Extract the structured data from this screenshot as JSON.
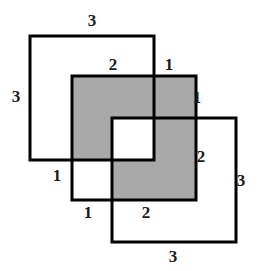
{
  "figure": {
    "kind": "overlapping-squares-diagram",
    "background_color": "#ffffff",
    "stroke_color": "#000000",
    "shaded_fill_color": "#a9a9a9",
    "white_fill_color": "#ffffff",
    "stroke_width": 3,
    "canvas": {
      "width": 260,
      "height": 271
    }
  },
  "squares": [
    {
      "id": "square-top-left",
      "name": "Square 1",
      "x": 30,
      "y": 36,
      "size": 124,
      "side_label": "3",
      "filled": false
    },
    {
      "id": "square-middle-shaded",
      "name": "Square 2",
      "x": 72,
      "y": 76,
      "size": 124,
      "side_label": "3",
      "filled": true
    },
    {
      "id": "square-bottom-right",
      "name": "Square 3",
      "x": 112,
      "y": 118,
      "size": 124,
      "side_label": "3",
      "filled": false
    }
  ],
  "labels": [
    {
      "id": "label-top-3",
      "text": "3",
      "x": 92,
      "y": 20,
      "edge": "top-of-square-1"
    },
    {
      "id": "label-left-3",
      "text": "3",
      "x": 16,
      "y": 96,
      "edge": "left-of-square-1"
    },
    {
      "id": "label-top-2",
      "text": "2",
      "x": 113,
      "y": 64,
      "edge": "top-of-square-2-left-part"
    },
    {
      "id": "label-top-1",
      "text": "1",
      "x": 169,
      "y": 64,
      "edge": "top-of-square-2-right-part"
    },
    {
      "id": "label-right-upper-1",
      "text": "1",
      "x": 197,
      "y": 97,
      "edge": "right-of-square-2-upper-part"
    },
    {
      "id": "label-right-2",
      "text": "2",
      "x": 201,
      "y": 156,
      "edge": "right-of-square-2-lower-part"
    },
    {
      "id": "label-far-right-3",
      "text": "3",
      "x": 241,
      "y": 180,
      "edge": "right-of-square-3"
    },
    {
      "id": "label-left-lower-1",
      "text": "1",
      "x": 57,
      "y": 175,
      "edge": "left-of-square-2-lower-part"
    },
    {
      "id": "label-bottom-1",
      "text": "1",
      "x": 88,
      "y": 212,
      "edge": "bottom-of-square-2-left-part"
    },
    {
      "id": "label-bottom-2",
      "text": "2",
      "x": 146,
      "y": 212,
      "edge": "bottom-of-square-2-right-part"
    },
    {
      "id": "label-bottom-3",
      "text": "3",
      "x": 173,
      "y": 256,
      "edge": "bottom-of-square-3"
    }
  ]
}
